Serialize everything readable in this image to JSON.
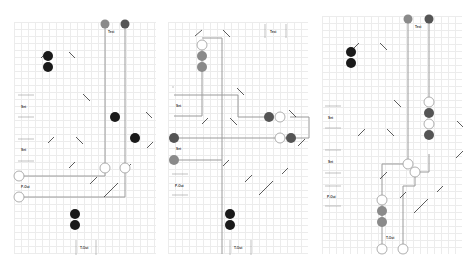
{
  "colors": {
    "grid": "#ececec",
    "track": "#9a9a9a",
    "node_light": "#8a8a8a",
    "node_dark": "#555555",
    "node_black": "#1a1a1a",
    "node_empty_stroke": "#9a9a9a",
    "diag": "#333333"
  },
  "boards": [
    {
      "id": "board-1",
      "labels": {
        "top": "Test",
        "left_top": "Set",
        "left_mid": "Set",
        "left_bottom": "P-Out",
        "bottom": "T-Out"
      }
    },
    {
      "id": "board-2",
      "labels": {
        "top": "Test",
        "left_top": "Set",
        "left_mid": "Set",
        "left_bottom": "P-Out",
        "bottom": "T-Out"
      }
    },
    {
      "id": "board-3",
      "labels": {
        "top": "Test",
        "left_top": "Set",
        "left_mid": "Set",
        "left_bottom": "P-Out",
        "bottom": "T-Out"
      }
    }
  ]
}
